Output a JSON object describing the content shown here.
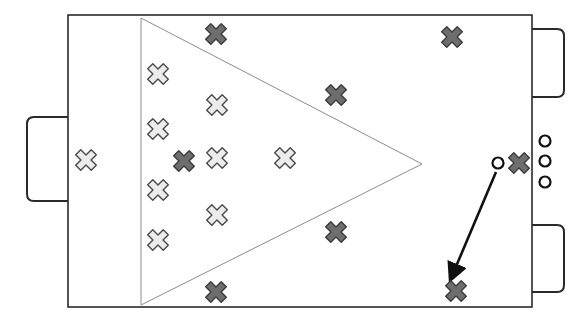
{
  "canvas": {
    "width": 588,
    "height": 327,
    "background": "#ffffff"
  },
  "colors": {
    "frame": "#2a2a2a",
    "triangle": "#8c8c8c",
    "light_marker_fill": "#ececec",
    "light_marker_stroke": "#4a4a4a",
    "dark_marker_fill": "#6e6e6e",
    "dark_marker_stroke": "#3c3c3c",
    "circle_stroke": "#111111",
    "arrow": "#111111"
  },
  "field": {
    "x": 68,
    "y": 15,
    "width": 464,
    "height": 292
  },
  "goals": [
    {
      "name": "left-goal",
      "x": 27,
      "y": 117,
      "width": 41,
      "height": 84,
      "side": "left"
    },
    {
      "name": "right-top-goal",
      "x": 532,
      "y": 29,
      "width": 32,
      "height": 68,
      "side": "right"
    },
    {
      "name": "right-bottom-goal",
      "x": 532,
      "y": 225,
      "width": 32,
      "height": 67,
      "side": "right"
    }
  ],
  "zone_triangle": {
    "points": [
      [
        141,
        18
      ],
      [
        422,
        164
      ],
      [
        141,
        305
      ]
    ]
  },
  "light_markers": [
    {
      "x": 86,
      "y": 160
    },
    {
      "x": 158,
      "y": 74
    },
    {
      "x": 217,
      "y": 105
    },
    {
      "x": 158,
      "y": 129
    },
    {
      "x": 217,
      "y": 158
    },
    {
      "x": 285,
      "y": 158
    },
    {
      "x": 158,
      "y": 190
    },
    {
      "x": 217,
      "y": 215
    },
    {
      "x": 158,
      "y": 240
    }
  ],
  "dark_markers": [
    {
      "x": 216,
      "y": 34
    },
    {
      "x": 452,
      "y": 37
    },
    {
      "x": 336,
      "y": 95
    },
    {
      "x": 184,
      "y": 161
    },
    {
      "x": 519,
      "y": 163
    },
    {
      "x": 336,
      "y": 232
    },
    {
      "x": 216,
      "y": 292
    },
    {
      "x": 456,
      "y": 291
    }
  ],
  "circles": [
    {
      "x": 498,
      "y": 163,
      "r": 5.5
    },
    {
      "x": 545,
      "y": 141,
      "r": 5.5
    },
    {
      "x": 545,
      "y": 161,
      "r": 5.5
    },
    {
      "x": 545,
      "y": 182,
      "r": 5.5
    }
  ],
  "arrows": [
    {
      "from": [
        496,
        172
      ],
      "to": [
        452,
        276
      ]
    }
  ]
}
